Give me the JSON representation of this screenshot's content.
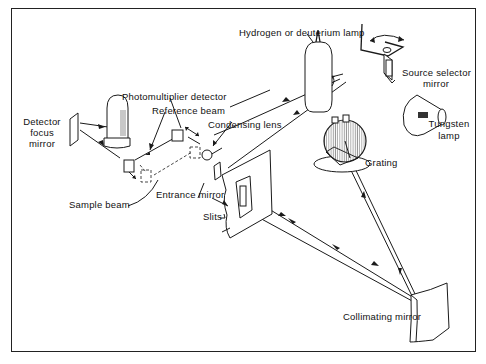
{
  "diagram": {
    "labels": {
      "hydrogen_lamp": "Hydrogen or deuterium lamp",
      "source_selector_line1": "Source selector",
      "source_selector_line2": "mirror",
      "tungsten_line1": "Tungsten",
      "tungsten_line2": "lamp",
      "photomultiplier": "Photomultiplier detector",
      "reference_beam": "Reference beam",
      "detector_focus_line1": "Detector",
      "detector_focus_line2": "focus",
      "detector_focus_line3": "mirror",
      "condensing_lens": "Condensing lens",
      "grating": "Grating",
      "sample_beam": "Sample beam",
      "entrance_mirror": "Entrance mirror",
      "slits": "Slits",
      "collimating_mirror": "Collimating mirror"
    },
    "components": [
      {
        "id": "hydrogen-lamp",
        "icon": "lamp-tube"
      },
      {
        "id": "source-selector-mirror",
        "icon": "pivot-mirror"
      },
      {
        "id": "tungsten-lamp",
        "icon": "bulb"
      },
      {
        "id": "photomultiplier-detector",
        "icon": "cylinder-detector"
      },
      {
        "id": "detector-focus-mirror",
        "icon": "flat-mirror"
      },
      {
        "id": "chopper-mirrors",
        "icon": "beam-splitter"
      },
      {
        "id": "condensing-lens",
        "icon": "lens"
      },
      {
        "id": "entrance-mirror",
        "icon": "flat-mirror"
      },
      {
        "id": "slits",
        "icon": "slit-plate"
      },
      {
        "id": "grating",
        "icon": "diffraction-grating"
      },
      {
        "id": "collimating-mirror",
        "icon": "concave-mirror"
      }
    ],
    "colors": {
      "line": "#1a1a1a",
      "background": "#ffffff"
    }
  }
}
